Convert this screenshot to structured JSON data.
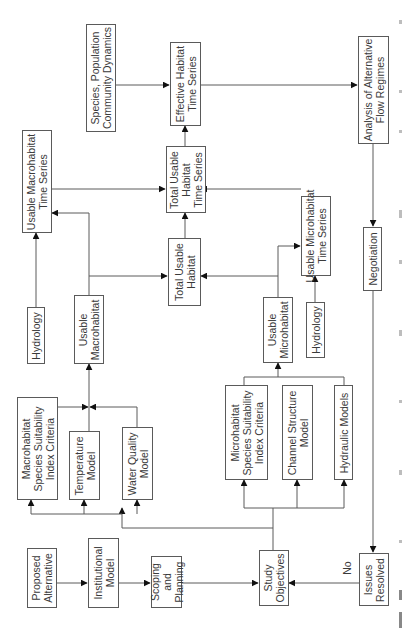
{
  "diagram": {
    "boxes": {
      "proposed_alternative": "Proposed\nAlternative",
      "institutional_model": "Institutional\nModel",
      "scoping_planning": "Scoping\nand\nPlanning",
      "study_objectives": "Study\nObjectives",
      "issues_resolved": "Issues\nResolved",
      "negotiation": "Negotiation",
      "analysis_flow_regimes": "Analysis of Alternative\nFlow Regimes",
      "species_population": "Species, Population\nCommunity Dynamics",
      "effective_habitat_ts": "Effective Habitat\nTime Series",
      "total_usable_habitat_ts": "Total Usable\nHabitat\nTime Series",
      "usable_macrohabitat_ts": "Usable Macrohabitat\nTime Series",
      "total_usable_habitat": "Total Usable\nHabitat",
      "usable_microhabitat_ts": "Usable Microhabitat\nTime Series",
      "hydrology_macro": "Hydrology",
      "usable_macrohabitat": "Usable\nMacrohabitat",
      "usable_microhabitat": "Usable\nMicrohabitat",
      "hydrology_micro": "Hydrology",
      "macrohabitat_ssi": "Macrohabitat\nSpecies Suitability\nIndex Criteria",
      "temperature_model": "Temperature\nModel",
      "water_quality_model": "Water Quality\nModel",
      "microhabitat_ssi": "Microhabitat\nSpecies Suitability\nIndex Criteria",
      "channel_structure_model": "Channel Structure\nModel",
      "hydraulic_models": "Hydraulic Models"
    },
    "labels": {
      "no": "No"
    },
    "colors": {
      "line": "#5a5a5a",
      "arrow": "#111111",
      "text": "#3a3a3a"
    }
  }
}
